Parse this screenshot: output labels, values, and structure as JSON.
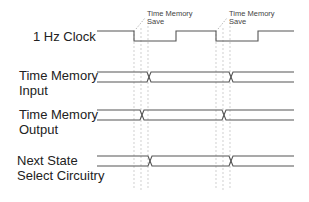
{
  "diagram": {
    "type": "timing-diagram",
    "signals": [
      {
        "name": "1 Hz Clock",
        "label_lines": [
          "1 Hz Clock"
        ],
        "kind": "clock"
      },
      {
        "name": "Time Memory Input",
        "label_lines": [
          "Time Memory",
          "Input"
        ],
        "kind": "bus"
      },
      {
        "name": "Time Memory Output",
        "label_lines": [
          "Time Memory",
          "Output"
        ],
        "kind": "bus"
      },
      {
        "name": "Next State Select Circuitry",
        "label_lines": [
          "Next State",
          "Select Circuitry"
        ],
        "kind": "bus"
      }
    ],
    "annotations": [
      {
        "text_lines": [
          "Time Memory",
          "Save"
        ]
      },
      {
        "text_lines": [
          "Time Memory",
          "Save"
        ]
      }
    ],
    "colors": {
      "line": "#555555",
      "guide": "#bbbbbb",
      "text": "#222222"
    }
  }
}
